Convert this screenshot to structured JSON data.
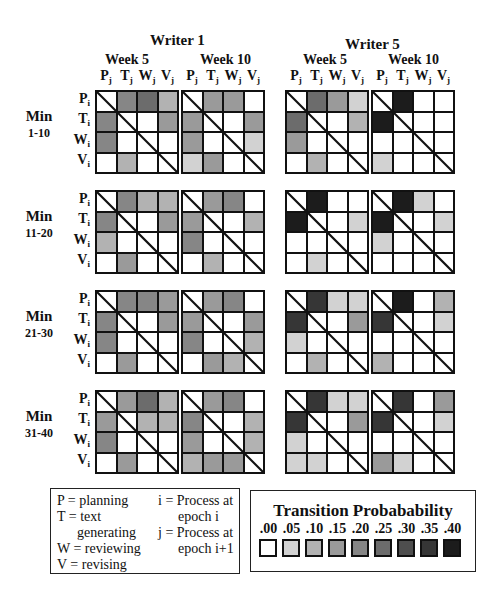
{
  "chart_data": {
    "type": "heatmap",
    "writers": [
      "Writer 1",
      "Writer 5"
    ],
    "weeks": [
      "Week 5",
      "Week 10"
    ],
    "epochs": [
      "Min 1-10",
      "Min 11-20",
      "Min 21-30",
      "Min 31-40"
    ],
    "row_labels": [
      "P_i",
      "T_i",
      "W_i",
      "V_i"
    ],
    "col_labels": [
      "P_j",
      "T_j",
      "W_j",
      "V_j"
    ],
    "diagonal": "not applicable (struck through)",
    "scale": {
      "min": 0.0,
      "max": 0.4,
      "step": 0.05
    },
    "matrices": {
      "Writer 1": {
        "Week 5": {
          "Min 1-10": [
            [
              null,
              0.2,
              0.25,
              0.1
            ],
            [
              0.2,
              null,
              0.0,
              0.15
            ],
            [
              0.2,
              0.0,
              null,
              0.0
            ],
            [
              0.0,
              0.1,
              0.0,
              null
            ]
          ],
          "Min 11-20": [
            [
              null,
              0.2,
              0.1,
              0.1
            ],
            [
              0.2,
              null,
              0.0,
              0.15
            ],
            [
              0.1,
              0.0,
              null,
              0.0
            ],
            [
              0.0,
              0.15,
              0.0,
              null
            ]
          ],
          "Min 21-30": [
            [
              null,
              0.2,
              0.2,
              0.15
            ],
            [
              0.2,
              null,
              0.0,
              0.15
            ],
            [
              0.2,
              0.0,
              null,
              0.0
            ],
            [
              0.0,
              0.15,
              0.0,
              null
            ]
          ],
          "Min 31-40": [
            [
              null,
              0.15,
              0.25,
              0.1
            ],
            [
              0.15,
              null,
              0.1,
              0.1
            ],
            [
              0.2,
              0.0,
              null,
              0.0
            ],
            [
              0.0,
              0.15,
              0.0,
              null
            ]
          ]
        },
        "Week 10": {
          "Min 1-10": [
            [
              null,
              0.15,
              0.15,
              0.0
            ],
            [
              0.15,
              null,
              0.0,
              0.15
            ],
            [
              0.15,
              0.0,
              null,
              0.05
            ],
            [
              0.05,
              0.15,
              0.0,
              null
            ]
          ],
          "Min 11-20": [
            [
              null,
              0.15,
              0.2,
              0.0
            ],
            [
              0.15,
              null,
              0.0,
              0.1
            ],
            [
              0.2,
              0.0,
              null,
              0.0
            ],
            [
              0.0,
              0.1,
              0.0,
              null
            ]
          ],
          "Min 21-30": [
            [
              null,
              0.15,
              0.2,
              0.0
            ],
            [
              0.15,
              null,
              0.0,
              0.15
            ],
            [
              0.2,
              0.0,
              null,
              0.1
            ],
            [
              0.0,
              0.15,
              0.1,
              null
            ]
          ],
          "Min 31-40": [
            [
              null,
              0.15,
              0.2,
              0.0
            ],
            [
              0.2,
              null,
              0.0,
              0.1
            ],
            [
              0.15,
              0.0,
              null,
              0.1
            ],
            [
              0.1,
              0.15,
              0.15,
              null
            ]
          ]
        }
      },
      "Writer 5": {
        "Week 5": {
          "Min 1-10": [
            [
              null,
              0.25,
              0.15,
              0.05
            ],
            [
              0.25,
              null,
              0.0,
              0.1
            ],
            [
              0.15,
              0.0,
              null,
              0.0
            ],
            [
              0.0,
              0.1,
              0.0,
              null
            ]
          ],
          "Min 11-20": [
            [
              null,
              0.4,
              0.0,
              0.0
            ],
            [
              0.4,
              null,
              0.0,
              0.05
            ],
            [
              0.0,
              0.0,
              null,
              0.0
            ],
            [
              0.0,
              0.05,
              0.0,
              null
            ]
          ],
          "Min 21-30": [
            [
              null,
              0.35,
              0.05,
              0.05
            ],
            [
              0.35,
              null,
              0.0,
              0.15
            ],
            [
              0.05,
              0.0,
              null,
              0.0
            ],
            [
              0.0,
              0.1,
              0.0,
              null
            ]
          ],
          "Min 31-40": [
            [
              null,
              0.35,
              0.05,
              0.05
            ],
            [
              0.35,
              null,
              0.0,
              0.15
            ],
            [
              0.05,
              0.0,
              null,
              0.0
            ],
            [
              0.05,
              0.05,
              0.0,
              null
            ]
          ]
        },
        "Week 10": {
          "Min 1-10": [
            [
              null,
              0.4,
              0.0,
              0.0
            ],
            [
              0.4,
              null,
              0.0,
              0.0
            ],
            [
              0.0,
              0.0,
              null,
              0.0
            ],
            [
              0.05,
              0.0,
              0.0,
              null
            ]
          ],
          "Min 11-20": [
            [
              null,
              0.4,
              0.05,
              0.0
            ],
            [
              0.4,
              null,
              0.0,
              0.05
            ],
            [
              0.05,
              0.0,
              null,
              0.0
            ],
            [
              0.0,
              0.0,
              0.0,
              null
            ]
          ],
          "Min 21-30": [
            [
              null,
              0.4,
              0.0,
              0.1
            ],
            [
              0.35,
              null,
              0.0,
              0.05
            ],
            [
              0.0,
              0.0,
              null,
              0.0
            ],
            [
              0.1,
              0.0,
              0.0,
              null
            ]
          ],
          "Min 31-40": [
            [
              null,
              0.35,
              0.0,
              0.15
            ],
            [
              0.35,
              null,
              0.0,
              0.05
            ],
            [
              0.0,
              0.0,
              null,
              0.0
            ],
            [
              0.15,
              0.05,
              0.0,
              null
            ]
          ]
        }
      }
    },
    "legend_position": "bottom"
  },
  "header": {
    "writer1": "Writer 1",
    "writer5": "Writer 5",
    "week5": "Week 5",
    "week10": "Week 10",
    "cols": [
      "P",
      "T",
      "W",
      "V"
    ],
    "col_sub": "j",
    "row_sub": "i"
  },
  "rows": {
    "labels": [
      "P",
      "T",
      "W",
      "V"
    ],
    "epochs": [
      {
        "top": "Min",
        "range": "1-10"
      },
      {
        "top": "Min",
        "range": "11-20"
      },
      {
        "top": "Min",
        "range": "21-30"
      },
      {
        "top": "Min",
        "range": "31-40"
      }
    ]
  },
  "key": {
    "lines_left": [
      "P  = planning",
      "T  = text",
      "generating",
      "W = reviewing",
      "V  = revising"
    ],
    "lines_right": [
      "i = Process at",
      "epoch  i",
      "j  = Process at",
      "epoch  i+1"
    ]
  },
  "prob_legend": {
    "title": "Transition Probabability",
    "ticks": [
      ".00",
      ".05",
      ".10",
      ".15",
      ".20",
      ".25",
      ".30",
      ".35",
      ".40"
    ],
    "colors": [
      "#ffffff",
      "#d2d2d2",
      "#b2b2b2",
      "#9a9a9a",
      "#868686",
      "#6c6c6c",
      "#4e4e4e",
      "#363636",
      "#1c1c1c"
    ]
  }
}
